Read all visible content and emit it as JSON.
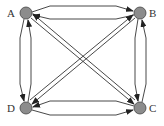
{
  "diagram": {
    "type": "complete-directed-graph",
    "nodes": [
      {
        "id": "A",
        "label": "A",
        "x": 26,
        "y": 13
      },
      {
        "id": "B",
        "label": "B",
        "x": 140,
        "y": 13
      },
      {
        "id": "C",
        "label": "C",
        "x": 140,
        "y": 108
      },
      {
        "id": "D",
        "label": "D",
        "x": 26,
        "y": 108
      }
    ],
    "edges": [
      {
        "from": "A",
        "to": "B"
      },
      {
        "from": "B",
        "to": "A"
      },
      {
        "from": "B",
        "to": "C"
      },
      {
        "from": "C",
        "to": "B"
      },
      {
        "from": "C",
        "to": "D"
      },
      {
        "from": "D",
        "to": "C"
      },
      {
        "from": "D",
        "to": "A"
      },
      {
        "from": "A",
        "to": "D"
      },
      {
        "from": "A",
        "to": "C"
      },
      {
        "from": "C",
        "to": "A"
      },
      {
        "from": "B",
        "to": "D"
      },
      {
        "from": "D",
        "to": "B"
      }
    ],
    "colors": {
      "node_fill": "#8c8c8c",
      "node_stroke": "#444444",
      "edge": "#333333"
    }
  }
}
